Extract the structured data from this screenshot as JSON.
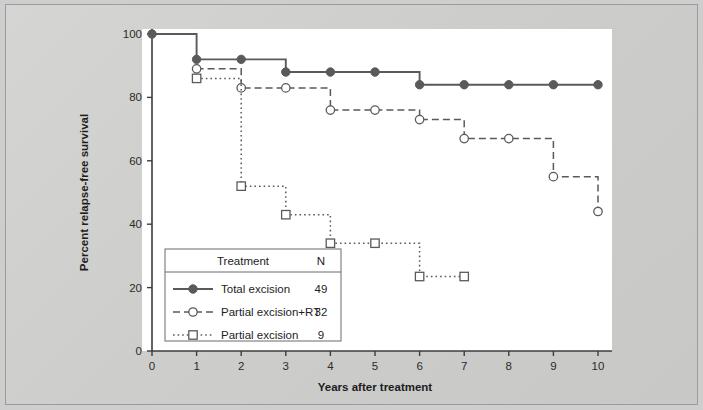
{
  "chart_data": {
    "type": "line",
    "subtype": "kaplan-meier-step",
    "title": "",
    "xlabel": "Years after treatment",
    "ylabel": "Percent relapse-free survival",
    "xlim": [
      0,
      10
    ],
    "ylim": [
      0,
      100
    ],
    "xticks": [
      "0",
      "1",
      "2",
      "3",
      "4",
      "5",
      "6",
      "7",
      "8",
      "9",
      "10"
    ],
    "yticks": [
      "0",
      "20",
      "40",
      "60",
      "80",
      "100"
    ],
    "grid": false,
    "legend_position": "inside-bottom-left",
    "x": [
      0,
      1,
      2,
      3,
      4,
      5,
      6,
      7,
      8,
      9,
      10
    ],
    "series": [
      {
        "name": "Total excision",
        "n": "49",
        "marker": "filled-circle",
        "line_style": "solid",
        "color": "#5a5a5a",
        "x": [
          0,
          1,
          2,
          3,
          4,
          5,
          6,
          7,
          8,
          9,
          10
        ],
        "values": [
          100,
          92,
          92,
          88,
          88,
          88,
          84,
          84,
          84,
          84,
          84
        ]
      },
      {
        "name": "Partial excision+RT",
        "n": "32",
        "marker": "open-circle",
        "line_style": "dashed",
        "color": "#5a5a5a",
        "x": [
          1,
          2,
          3,
          4,
          5,
          6,
          7,
          8,
          9,
          10
        ],
        "values": [
          89,
          83,
          83,
          76,
          76,
          73,
          67,
          67,
          55,
          44
        ]
      },
      {
        "name": "Partial excision",
        "n": "9",
        "marker": "open-square",
        "line_style": "dotted",
        "color": "#5a5a5a",
        "x": [
          1,
          2,
          3,
          4,
          5,
          6,
          7
        ],
        "values": [
          86,
          52,
          43,
          34,
          34,
          23.5,
          23.5
        ]
      }
    ]
  },
  "legend": {
    "header_treatment": "Treatment",
    "header_n": "N",
    "rows": [
      {
        "label": "Total excision",
        "n": "49"
      },
      {
        "label": "Partial excision+RT",
        "n": "32"
      },
      {
        "label": "Partial excision",
        "n": "9"
      }
    ]
  },
  "colors": {
    "line": "#5a5a5a",
    "axis": "#3c3c3c",
    "panel": "#ffffff",
    "background": "#cecece",
    "text": "#1d1d1d"
  }
}
